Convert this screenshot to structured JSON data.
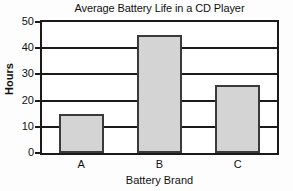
{
  "chart_data": {
    "type": "bar",
    "title": "Average Battery Life in a CD Player",
    "xlabel": "Battery Brand",
    "ylabel": "Hours",
    "categories": [
      "A",
      "B",
      "C"
    ],
    "values": [
      15,
      45,
      26
    ],
    "ylim": [
      0,
      50
    ],
    "yticks": [
      0,
      10,
      20,
      30,
      40,
      50
    ],
    "ytick_labels": [
      "0",
      "10",
      "20",
      "30",
      "40",
      "50"
    ],
    "grid": true,
    "legend": "none",
    "bar_fill_color": "#d4d4d4",
    "bar_border_color": "#3a3a3a",
    "axis_color": "#1a1a1a",
    "background_color": "#ffffff"
  }
}
